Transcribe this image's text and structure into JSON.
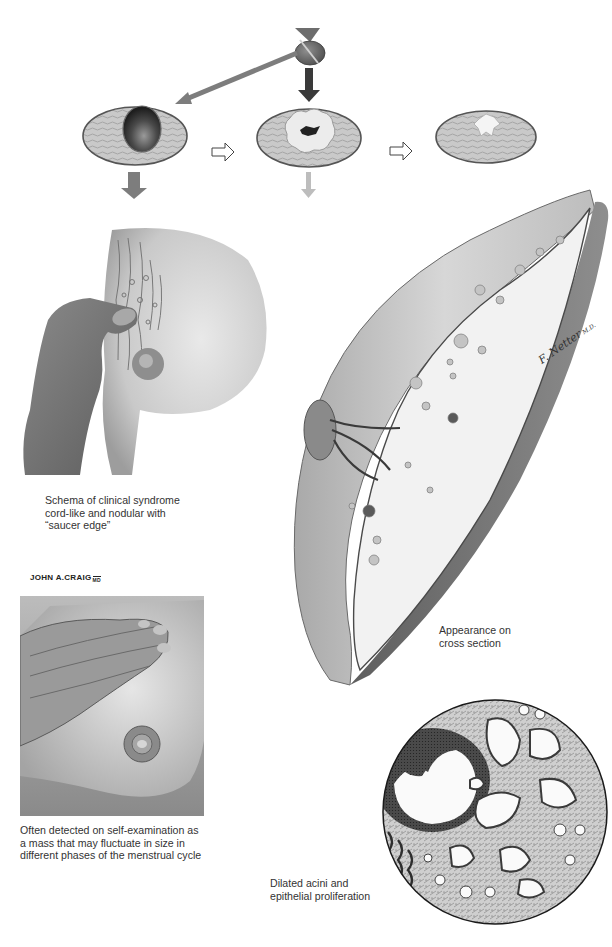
{
  "figure": {
    "type": "medical-illustration",
    "palette": {
      "background": "#ffffff",
      "skin_light": "#e2e2e2",
      "skin_mid": "#bdbdbd",
      "skin_dark": "#6e6e6e",
      "ink": "#2b2b2b",
      "arrow_dark": "#3a3a3a",
      "arrow_mid": "#7d7d7d",
      "arrow_light": "#bdbdbd"
    },
    "top_diagram": {
      "source_icon": "gland-icon",
      "stages": [
        {
          "id": "cyst",
          "desc": "cross section with dark cyst"
        },
        {
          "id": "proliferation",
          "desc": "cross section with lobulated white proliferative focus"
        },
        {
          "id": "fibrosis",
          "desc": "cross section with small white scar"
        }
      ],
      "arrows": [
        {
          "from": "gland",
          "to": "cyst",
          "style": "mid-gray diagonal"
        },
        {
          "from": "gland",
          "to": "proliferation",
          "style": "dark vertical"
        },
        {
          "from": "cyst",
          "to": "proliferation",
          "style": "outlined horizontal"
        },
        {
          "from": "proliferation",
          "to": "fibrosis",
          "style": "outlined horizontal"
        },
        {
          "from": "cyst",
          "to": "clinical schema",
          "style": "mid-gray down"
        },
        {
          "from": "proliferation",
          "to": "cross section",
          "style": "light-gray down"
        }
      ]
    },
    "captions": {
      "schema": "Schema of clinical syndrome\ncord-like and nodular with\n“saucer edge”",
      "cross_section": "Appearance on\ncross section",
      "self_exam": "Often detected on self-examination as\na mass that may fluctuate in size in\ndifferent phases of the menstrual cycle",
      "histology": "Dilated acini and\nepithelial proliferation"
    },
    "signatures": {
      "craig": "JOHN A.CRAIG",
      "craig_suffix": "MD",
      "netter": "F. Netter",
      "netter_suffix": "M.D."
    }
  }
}
